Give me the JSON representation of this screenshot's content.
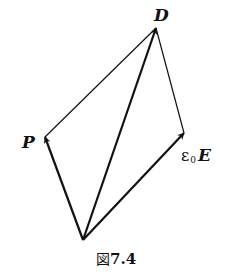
{
  "figure": {
    "caption_prefix": "図",
    "caption_number": "7.4",
    "line_color": "#111111",
    "background": "#ffffff"
  },
  "points": {
    "origin": {
      "x": 83,
      "y": 240
    },
    "P": {
      "x": 45,
      "y": 137
    },
    "D": {
      "x": 156,
      "y": 28
    },
    "E": {
      "x": 184,
      "y": 133
    }
  },
  "vectors": [
    {
      "name": "P",
      "from": "origin",
      "to": "P",
      "style": "thick-arrow"
    },
    {
      "name": "D",
      "from": "origin",
      "to": "D",
      "style": "thick-arrow"
    },
    {
      "name": "epsilon0-E",
      "from": "origin",
      "to": "E",
      "style": "thick-arrow"
    },
    {
      "name": "P-to-D",
      "from": "P",
      "to": "D",
      "style": "thin-line"
    },
    {
      "name": "E-to-D",
      "from": "E",
      "to": "D",
      "style": "thin-line"
    }
  ],
  "labels": {
    "D": "D",
    "P": "P",
    "E_coef": "ε",
    "E_sub": "0",
    "E_sym": "E"
  }
}
